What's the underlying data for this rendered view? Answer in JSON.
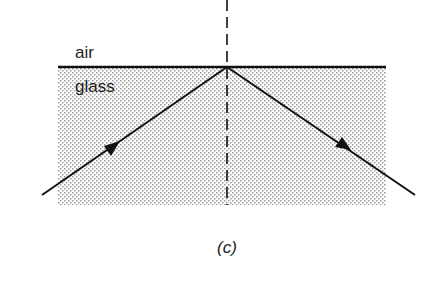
{
  "figure": {
    "caption": "(c)",
    "labels": {
      "upper_medium": "air",
      "lower_medium": "glass"
    },
    "elements": {
      "interface": "air-glass boundary",
      "normal": "dashed normal line",
      "incident_ray": "incident ray in glass",
      "reflected_ray": "totally internally reflected ray"
    }
  }
}
